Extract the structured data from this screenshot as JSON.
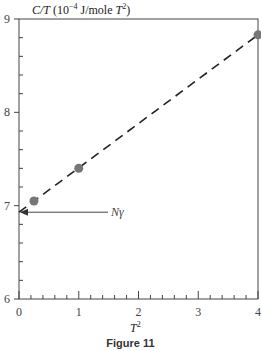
{
  "chart_data": {
    "type": "scatter",
    "title": "",
    "caption": "Figure 11",
    "xlabel": "T²",
    "ylabel": "C/T (10⁻⁴ J/mole T²)",
    "xlim": [
      0,
      4
    ],
    "ylim": [
      6,
      9
    ],
    "x_ticks": [
      0,
      1,
      2,
      3,
      4
    ],
    "y_ticks": [
      6,
      7,
      8,
      9
    ],
    "grid": false,
    "series": [
      {
        "name": "data points",
        "marker": "circle",
        "color": "#777777",
        "x": [
          0.25,
          1.0,
          4.0
        ],
        "y": [
          7.05,
          7.4,
          8.83
        ]
      },
      {
        "name": "linear fit",
        "style": "dashed",
        "color": "#222222",
        "x": [
          0.0,
          4.0
        ],
        "y": [
          6.93,
          8.83
        ]
      }
    ],
    "annotations": [
      {
        "text": "Nγ",
        "points_to": {
          "x": 0,
          "y": 6.93
        },
        "type": "arrow"
      }
    ]
  },
  "labels": {
    "ylabel_prefix": "C/T",
    "ylabel_units": "(10",
    "ylabel_exp": "−4",
    "ylabel_units2": " J/mole ",
    "ylabel_T": "T",
    "ylabel_T_exp": "2",
    "ylabel_close": ")",
    "xlabel_T": "T",
    "xlabel_exp": "2",
    "caption": "Figure 11",
    "annotation": "Nγ",
    "x_tick_labels": [
      "0",
      "1",
      "2",
      "3",
      "4"
    ],
    "y_tick_labels": [
      "6",
      "7",
      "8",
      "9"
    ]
  }
}
